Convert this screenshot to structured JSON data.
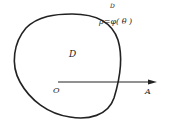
{
  "diagram": {
    "type": "polar-region",
    "labels": {
      "top_label": "D",
      "curve_equation": "ρ=φ( θ )",
      "region": "D",
      "origin": "O",
      "polar_axis_end": "A"
    },
    "colors": {
      "stroke": "#222222",
      "background": "#ffffff"
    }
  }
}
